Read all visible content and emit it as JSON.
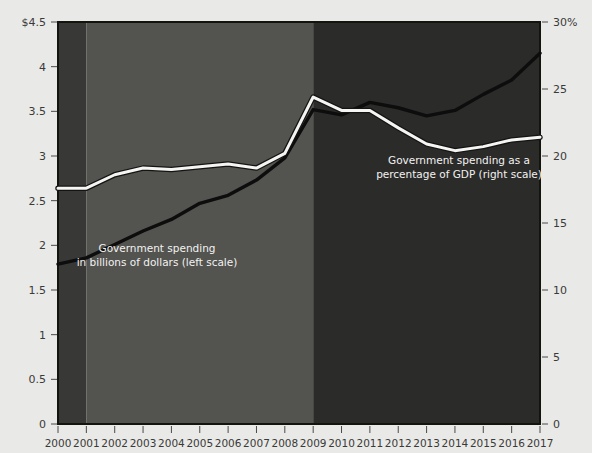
{
  "chart_data": {
    "type": "line",
    "title": "",
    "subtitle": "",
    "xlabel": "",
    "ylabel": "",
    "grid": false,
    "legend_position": "inline-annotations",
    "x": [
      2000,
      2001,
      2002,
      2003,
      2004,
      2005,
      2006,
      2007,
      2008,
      2009,
      2010,
      2011,
      2012,
      2013,
      2014,
      2015,
      2016,
      2017
    ],
    "x_tick_labels": [
      "2000",
      "2001",
      "2002",
      "2003",
      "2004",
      "2005",
      "2006",
      "2007",
      "2008",
      "2009",
      "2010",
      "2011",
      "2012",
      "2013",
      "2014",
      "2015",
      "2016",
      "2017"
    ],
    "axes": {
      "left": {
        "label": "",
        "unit": "trillions of dollars",
        "ylim": [
          0,
          4.5
        ],
        "ticks": [
          0,
          0.5,
          1,
          1.5,
          2,
          2.5,
          3,
          3.5,
          4,
          4.5
        ],
        "tick_labels": [
          "0",
          "0.5",
          "1",
          "1.5",
          "2",
          "2.5",
          "3",
          "3.5",
          "4",
          "$4.5"
        ]
      },
      "right": {
        "label": "",
        "unit": "percent of GDP",
        "ylim": [
          0,
          30
        ],
        "ticks": [
          0,
          5,
          10,
          15,
          20,
          25,
          30
        ],
        "tick_labels": [
          "0",
          "5",
          "10",
          "15",
          "20",
          "25",
          "30%"
        ]
      }
    },
    "series": [
      {
        "name": "Government spending in billions of dollars (left scale)",
        "axis": "left",
        "color": "#0d0d0d",
        "values": [
          1.79,
          1.86,
          2.01,
          2.16,
          2.29,
          2.47,
          2.56,
          2.73,
          2.98,
          3.52,
          3.46,
          3.6,
          3.54,
          3.45,
          3.51,
          3.69,
          3.85,
          4.15
        ]
      },
      {
        "name": "Government spending as a percentage of GDP (right scale)",
        "axis": "right",
        "color": "#f5f5f3",
        "values": [
          17.6,
          17.6,
          18.6,
          19.1,
          19.0,
          19.2,
          19.4,
          19.1,
          20.2,
          24.4,
          23.4,
          23.4,
          22.1,
          20.9,
          20.4,
          20.7,
          21.2,
          21.4
        ]
      }
    ],
    "annotations": [
      {
        "name": "left-scale-annotation",
        "lines": [
          "Government spending",
          "in billions of dollars (left scale)"
        ],
        "x": 157,
        "y": 252
      },
      {
        "name": "right-scale-annotation",
        "lines": [
          "Government spending as a",
          "percentage of GDP (right scale)"
        ],
        "x": 459,
        "y": 164
      }
    ],
    "shaded_bands": [
      {
        "name": "band-2000-2001",
        "from": 2000,
        "to": 2001,
        "color": "#383837"
      },
      {
        "name": "band-2001-2009",
        "from": 2001,
        "to": 2009,
        "color": "#53534f"
      },
      {
        "name": "band-2009-2017",
        "from": 2009,
        "to": 2017,
        "color": "#2b2b2a"
      }
    ]
  },
  "style": {
    "page_background": "#e9e9e7",
    "tick_text_color": "#3a3a38",
    "annotation_text_color": "#f2f2f0"
  }
}
